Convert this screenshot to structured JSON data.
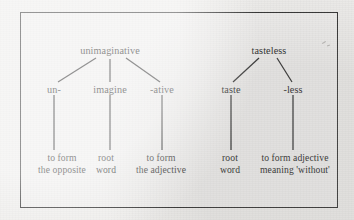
{
  "figure": {
    "type": "morphology-tree-diagram",
    "border_color": "#2b2b2b",
    "background_color": "#efeeec",
    "text_color": "#1a1a1a",
    "trees": [
      {
        "id": "unimaginative",
        "root": "unimaginative",
        "morphemes": [
          {
            "label": "un-",
            "description_line1": "to form",
            "description_line2": "the opposite"
          },
          {
            "label": "imagine",
            "description_line1": "root",
            "description_line2": "word"
          },
          {
            "label": "-ative",
            "description_line1": "to form",
            "description_line2": "the adjective"
          }
        ]
      },
      {
        "id": "tasteless",
        "root": "tasteless",
        "morphemes": [
          {
            "label": "taste",
            "description_line1": "root",
            "description_line2": "word"
          },
          {
            "label": "-less",
            "description_line1": "to form adjective",
            "description_line2": "meaning 'without'"
          }
        ]
      }
    ]
  }
}
